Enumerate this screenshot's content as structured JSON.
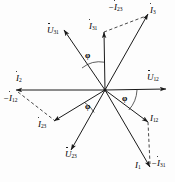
{
  "diagram": {
    "type": "phasor-vector-diagram",
    "origin": {
      "x": 105,
      "y": 90
    },
    "stroke_color": "#1a1a1a",
    "background_color": "#fdfdfd",
    "angle_symbol": "φ",
    "angle_markers": [
      {
        "name": "phi-u31-i31",
        "label": "φ",
        "x": 88,
        "y": 55
      },
      {
        "name": "phi-u12-i12",
        "label": "φ",
        "x": 124,
        "y": 97
      },
      {
        "name": "phi-u23-i23",
        "label": "φ",
        "x": 88,
        "y": 103
      }
    ],
    "vectors": [
      {
        "name": "I3",
        "label_base": "I",
        "label_sub": "3",
        "dotted": true,
        "dashed": false,
        "tip": {
          "x": 148,
          "y": 14
        },
        "label_x": 150,
        "label_y": 7
      },
      {
        "name": "I31",
        "label_base": "I",
        "label_sub": "31",
        "dotted": true,
        "dashed": false,
        "tip": {
          "x": 104,
          "y": 32
        },
        "label_x": 91,
        "label_y": 24
      },
      {
        "name": "U31",
        "label_base": "U",
        "label_sub": "31",
        "dotted": true,
        "dashed": false,
        "tip": {
          "x": 64,
          "y": 30
        },
        "label_x": 50,
        "label_y": 28
      },
      {
        "name": "I2",
        "label_base": "I",
        "label_sub": "2",
        "dotted": true,
        "dashed": false,
        "tip": {
          "x": 16,
          "y": 90
        },
        "label_x": 18,
        "label_y": 78
      },
      {
        "name": "U12",
        "label_base": "U",
        "label_sub": "12",
        "dotted": true,
        "dashed": false,
        "tip": {
          "x": 166,
          "y": 89
        },
        "label_x": 148,
        "label_y": 76
      },
      {
        "name": "I23",
        "label_base": "I",
        "label_sub": "23",
        "dotted": true,
        "dashed": false,
        "tip": {
          "x": 54,
          "y": 121
        },
        "label_x": 40,
        "label_y": 123
      },
      {
        "name": "U23",
        "label_base": "U",
        "label_sub": "23",
        "dotted": true,
        "dashed": false,
        "tip": {
          "x": 71,
          "y": 150
        },
        "label_x": 67,
        "label_y": 152
      },
      {
        "name": "I12",
        "label_base": "I",
        "label_sub": "12",
        "dotted": false,
        "dashed": false,
        "tip": {
          "x": 148,
          "y": 122
        },
        "label_x": 150,
        "label_y": 118
      },
      {
        "name": "I1",
        "label_base": "I",
        "label_sub": "1",
        "dotted": false,
        "dashed": false,
        "tip": {
          "x": 150,
          "y": 167
        },
        "label_x": 137,
        "label_y": 163
      }
    ],
    "dashed_constructions": [
      {
        "name": "neg-I23",
        "label_base": "I",
        "label_sub": "23",
        "negative": true,
        "dotted": true,
        "from": {
          "x": 104,
          "y": 32
        },
        "to": {
          "x": 146,
          "y": 16
        },
        "label_x": 110,
        "label_y": 5
      },
      {
        "name": "neg-I12",
        "label_base": "I",
        "label_sub": "12",
        "negative": true,
        "dotted": true,
        "from": {
          "x": 18,
          "y": 92
        },
        "to": {
          "x": 54,
          "y": 120
        },
        "label_x": 8,
        "label_y": 97
      },
      {
        "name": "neg-I31",
        "label_base": "I",
        "label_sub": "31",
        "negative": true,
        "dotted": true,
        "from": {
          "x": 148,
          "y": 122
        },
        "to": {
          "x": 150,
          "y": 164
        },
        "label_x": 152,
        "label_y": 161
      }
    ]
  }
}
